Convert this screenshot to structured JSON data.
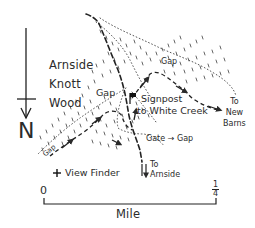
{
  "map": {
    "title_area": {
      "wood_name_lines": [
        "Arnside",
        "Knott",
        "Wood"
      ]
    },
    "compass": {
      "label": "N"
    },
    "labels": {
      "gap_top": "Gap",
      "gap_left": "Gap",
      "gap_lower_left": "Gap",
      "signpost_line1": "Signpost",
      "signpost_line2": "to White Creek",
      "new_barns_lines": [
        "To",
        "New",
        "Barns"
      ],
      "gate_gap": "Gate → Gap",
      "to_arnside_lines": [
        "To",
        "Arnside"
      ],
      "view_finder": "View Finder"
    },
    "scale_bar": {
      "start": "0",
      "end_numerator": "1",
      "end_denominator": "4",
      "unit": "Mile"
    },
    "icons": {
      "compass": "north-arrow-icon",
      "signpost": "flag-icon",
      "view_finder": "cross-marker-icon"
    },
    "colors": {
      "ink": "#2a2a2a",
      "background": "#ffffff"
    }
  }
}
